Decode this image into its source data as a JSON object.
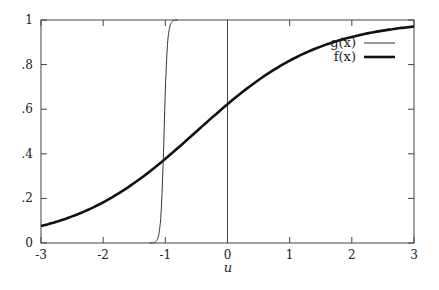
{
  "chart_data": {
    "type": "line",
    "title": "",
    "xlabel": "u",
    "ylabel": "",
    "xlim": [
      -3,
      3
    ],
    "ylim": [
      0,
      1
    ],
    "grid": false,
    "legend_position": "top-right",
    "x_ticks": [
      -3,
      -2,
      -1,
      0,
      1,
      2,
      3
    ],
    "x_tick_labels": [
      "-3",
      "-2",
      "-1",
      "0",
      "1",
      "2",
      "3"
    ],
    "y_ticks": [
      0,
      0.2,
      0.4,
      0.6,
      0.8,
      1
    ],
    "y_tick_labels": [
      "0",
      ".2",
      ".4",
      ".6",
      ".8",
      "1"
    ],
    "vertical_reference_line_x": 0,
    "series": [
      {
        "name": "g(x)",
        "style": "thin",
        "description": "steep sigmoid centered near u = -1.02",
        "x": [
          -3,
          -1.2,
          -1.15,
          -1.1,
          -1.05,
          -1.02,
          -1.0,
          -0.95,
          -0.9,
          -0.85,
          3
        ],
        "y": [
          0,
          0.002,
          0.03,
          0.06,
          0.26,
          0.5,
          0.67,
          0.93,
          0.99,
          1.0,
          1.0
        ]
      },
      {
        "name": "f(x)",
        "style": "thick",
        "description": "logistic 1/(1+exp(-(u+0.5)))",
        "x": [
          -3,
          -2.5,
          -2,
          -1.5,
          -1,
          -0.5,
          0,
          0.5,
          1,
          1.5,
          2,
          2.5,
          3
        ],
        "y": [
          0.076,
          0.119,
          0.182,
          0.269,
          0.378,
          0.5,
          0.622,
          0.731,
          0.818,
          0.881,
          0.924,
          0.953,
          0.971
        ]
      }
    ]
  },
  "legend": {
    "g_label": "g(x)",
    "f_label": "f(x)"
  },
  "axes": {
    "x_title": "u"
  }
}
